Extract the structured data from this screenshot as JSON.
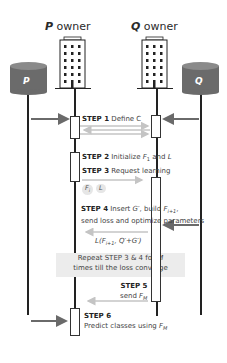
{
  "diagram": {
    "participants": [
      {
        "id": "P",
        "label": "P",
        "kind": "database"
      },
      {
        "id": "P_owner",
        "label_bold": "P",
        "label_rest": " owner",
        "kind": "building"
      },
      {
        "id": "Q_owner",
        "label_bold": "Q",
        "label_rest": " owner",
        "kind": "building"
      },
      {
        "id": "Q",
        "label": "Q",
        "kind": "database"
      }
    ],
    "steps": {
      "s1": {
        "num": "STEP 1",
        "text": " Define C"
      },
      "s2": {
        "num": "STEP 2",
        "text_a": " Initialize ",
        "var": "F",
        "sub": "1",
        "text_b": " and ",
        "var2": "L"
      },
      "s3": {
        "num": "STEP 3",
        "text": " Request learning"
      },
      "s3_pills": [
        "F",
        "L"
      ],
      "s3_pill_sub": "i",
      "s4": {
        "num": "STEP 4",
        "text_a": " Insert ",
        "var": "G′",
        "text_b": ", build ",
        "var2": "F",
        "sub2": "i+1",
        "text_c": ",",
        "line2": "send loss and optimize parameters"
      },
      "s4_loss": {
        "pre": "L(F",
        "sub": "i+1",
        "post": ", Q′+G′)"
      },
      "repeat": {
        "line1_a": "Repeat STEP 3 & 4 for ",
        "line1_var": "M",
        "line2": "times till the loss converge"
      },
      "s5": {
        "num": "STEP 5",
        "text": "send ",
        "var": "F",
        "sub": "M"
      },
      "s6": {
        "num": "STEP 6",
        "text": "Predict classes using ",
        "var": "F",
        "sub": "M"
      }
    },
    "colors": {
      "database": "#6b6b6b",
      "database_top": "#8a8a8a",
      "arrow_dark": "#6a6a6a",
      "arrow_light": "#c4c4c4",
      "lifeline": "#222222",
      "repeat_bg": "#ececec"
    }
  }
}
